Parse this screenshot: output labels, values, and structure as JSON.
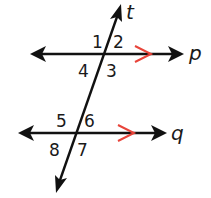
{
  "diagram": {
    "lines": {
      "p": {
        "label": "p",
        "y": 54,
        "x1": 32,
        "x2": 182,
        "parallel_mark": true
      },
      "q": {
        "label": "q",
        "y": 133,
        "x1": 20,
        "x2": 165,
        "parallel_mark": true
      },
      "t": {
        "label": "t",
        "top": [
          121,
          5
        ],
        "bottom": [
          56,
          192
        ]
      }
    },
    "angles": [
      {
        "id": "1",
        "label": "1"
      },
      {
        "id": "2",
        "label": "2"
      },
      {
        "id": "3",
        "label": "3"
      },
      {
        "id": "4",
        "label": "4"
      },
      {
        "id": "5",
        "label": "5"
      },
      {
        "id": "6",
        "label": "6"
      },
      {
        "id": "7",
        "label": "7"
      },
      {
        "id": "8",
        "label": "8"
      }
    ],
    "colors": {
      "line": "#111111",
      "parallel_mark": "#e8443a",
      "text": "#1a1a1a"
    }
  }
}
